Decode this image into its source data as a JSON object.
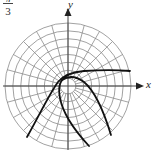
{
  "figure": {
    "corner_label": {
      "numerator": "π",
      "denominator": "3"
    },
    "axes": {
      "x_label": "x",
      "y_label": "y"
    },
    "grid": {
      "type": "polar",
      "rings": 8,
      "spokes": 24,
      "spoke_step_deg": 15
    },
    "colors": {
      "grid": "#8a8a8a",
      "axis": "#444444",
      "curve": "#111111",
      "background": "#ffffff"
    }
  }
}
